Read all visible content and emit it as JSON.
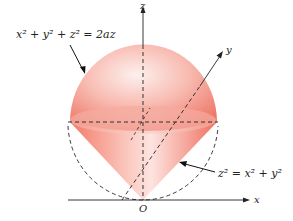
{
  "diagram": {
    "type": "3d-solid-figure",
    "labels": {
      "sphere_equation": "x² + y² + z² = 2az",
      "cone_equation": "z² = x² + y²",
      "axis_x": "x",
      "axis_y": "y",
      "axis_z": "z",
      "origin": "O"
    },
    "colors": {
      "solid_fill": "#f08070",
      "solid_highlight": "#fde8e4",
      "axis_line": "#222222",
      "dashed_line": "#222222",
      "background": "#ffffff"
    }
  }
}
